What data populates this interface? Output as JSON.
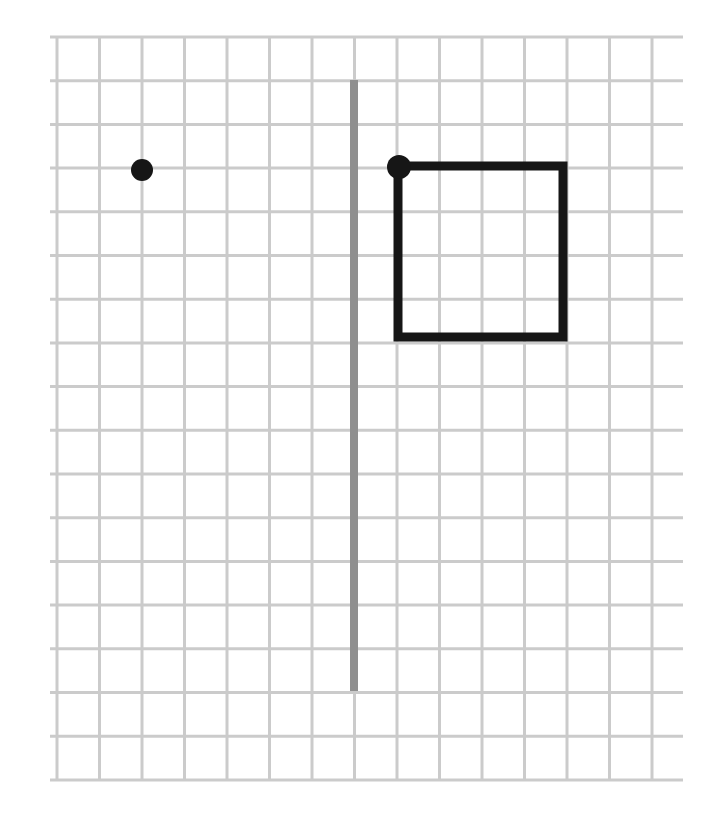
{
  "figure": {
    "width": 720,
    "height": 828,
    "background_color": "#ffffff"
  },
  "grid": {
    "line_color": "#cbcbcb",
    "line_width": 3,
    "vertical_lines": {
      "x_start": 57,
      "spacing": 42.5,
      "count": 15,
      "y_top": 37,
      "y_bottom": 780
    },
    "horizontal_lines": {
      "y_start": 37,
      "spacing": 43.7,
      "count": 18,
      "x_left": 50,
      "x_right": 683
    }
  },
  "mirror_line": {
    "x": 354,
    "y_top": 80,
    "y_bottom": 691,
    "stroke_width": 8,
    "color": "#8f8f8f"
  },
  "square": {
    "left": 398,
    "top": 166,
    "right": 563,
    "bottom": 337,
    "stroke_width": 9,
    "color": "#161616",
    "fill": "none"
  },
  "points": [
    {
      "name": "marked-point-left-of-mirror",
      "cx": 142,
      "cy": 170,
      "r": 11,
      "color": "#161616"
    },
    {
      "name": "square-top-left-vertex-point",
      "cx": 399,
      "cy": 167,
      "r": 12,
      "color": "#161616"
    }
  ]
}
